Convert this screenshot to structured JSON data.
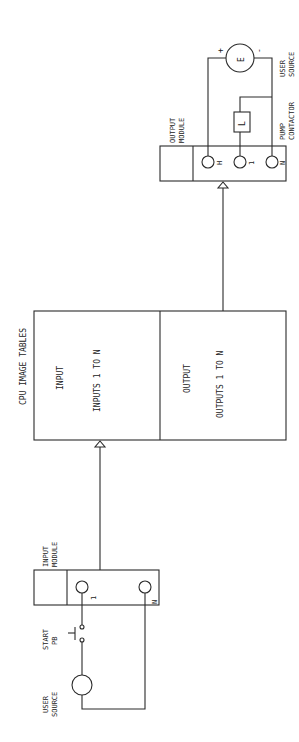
{
  "diagram": {
    "type": "plc-io-wiring",
    "orientation": "rotated-90-ccw",
    "cpu": {
      "title": "CPU IMAGE TABLES",
      "input_section": {
        "heading": "INPUT",
        "range": "INPUTS 1 TO N"
      },
      "output_section": {
        "heading": "OUTPUT",
        "range": "OUTPUTS 1 TO N"
      }
    },
    "input_module": {
      "label_line1": "INPUT",
      "label_line2": "MODULE",
      "terminals": [
        "1",
        "N"
      ]
    },
    "output_module": {
      "label_line1": "OUTPUT",
      "label_line2": "MODULE",
      "terminals": [
        "H",
        "1",
        "N"
      ]
    },
    "input_circuit": {
      "pushbutton_line1": "START",
      "pushbutton_line2": "PB",
      "source_line1": "USER",
      "source_line2": "SOURCE"
    },
    "output_circuit": {
      "source_symbol": "E",
      "source_plus": "+",
      "source_minus": "-",
      "source_line1": "USER",
      "source_line2": "SOURCE",
      "load_symbol": "L",
      "load_line1": "PUMP",
      "load_line2": "CONTACTOR"
    }
  }
}
